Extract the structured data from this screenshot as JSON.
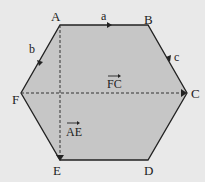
{
  "diagram": {
    "colors": {
      "background": "#e9e9e9",
      "fill": "#c6c6c6",
      "stroke": "#222222"
    },
    "vertices": {
      "A": {
        "label": "A",
        "x": 60,
        "y": 25
      },
      "B": {
        "label": "B",
        "x": 148,
        "y": 25
      },
      "C": {
        "label": "C",
        "x": 187,
        "y": 93
      },
      "D": {
        "label": "D",
        "x": 148,
        "y": 160
      },
      "E": {
        "label": "E",
        "x": 60,
        "y": 160
      },
      "F": {
        "label": "F",
        "x": 21,
        "y": 93
      }
    },
    "vectors": {
      "a": {
        "label": "a",
        "from": "A",
        "to": "B"
      },
      "b": {
        "label": "b",
        "from": "A",
        "to": "F"
      },
      "c": {
        "label": "c",
        "from": "B",
        "to": "C"
      },
      "FC": {
        "label": "FC",
        "from": "F",
        "to": "C",
        "style": "dashed"
      },
      "AE": {
        "label": "AE",
        "from": "A",
        "to": "E",
        "style": "dashed"
      }
    }
  }
}
